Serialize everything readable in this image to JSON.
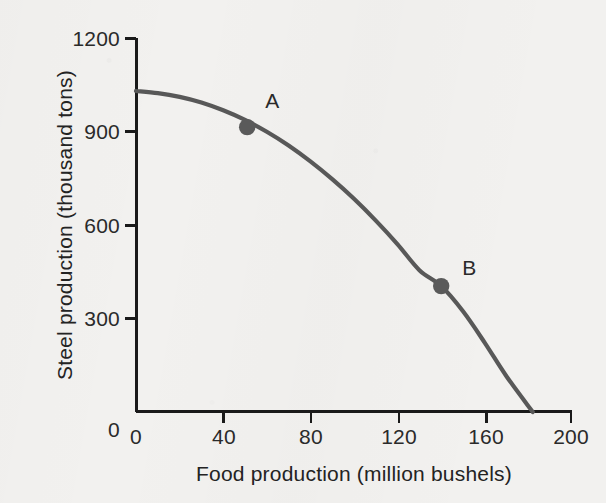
{
  "figure": {
    "width": 606,
    "height": 503,
    "background_color": "#f2f1ef",
    "curve_color": "#585858",
    "axis_color": "#1a1a1a",
    "text_color": "#2a2a2a"
  },
  "chart_data": {
    "type": "line",
    "title": "",
    "subtitle": "",
    "xlabel": "Food production (million bushels)",
    "ylabel": "Steel production (thousand tons)",
    "xlim": [
      0,
      200
    ],
    "ylim": [
      0,
      1200
    ],
    "xticks": [
      0,
      40,
      80,
      120,
      160,
      200
    ],
    "xtick_labels": [
      "0",
      "40",
      "80",
      "120",
      "160",
      "200"
    ],
    "yticks": [
      0,
      300,
      600,
      900,
      1200
    ],
    "ytick_labels": [
      "0",
      "300",
      "600",
      "900",
      "1200"
    ],
    "grid": false,
    "legend": "none",
    "series": [
      {
        "name": "production possibilities frontier",
        "x": [
          0,
          10,
          20,
          30,
          40,
          50,
          60,
          70,
          80,
          90,
          100,
          110,
          120,
          130,
          140,
          150,
          160,
          170,
          182
        ],
        "y": [
          1030,
          1023,
          1011,
          993,
          968,
          937,
          899,
          855,
          804,
          747,
          684,
          614,
          538,
          455,
          404,
          323,
          222,
          114,
          0
        ]
      }
    ],
    "annotations": [
      {
        "label": "A",
        "x": 51,
        "y": 914,
        "label_dx": 18,
        "label_dy": -24
      },
      {
        "label": "B",
        "x": 140,
        "y": 404,
        "label_dx": 21,
        "label_dy": -16
      }
    ]
  },
  "axes": {
    "x_title": "Food production (million bushels)",
    "y_title": "Steel production (thousand tons)",
    "x_tick_labels": [
      "0",
      "40",
      "80",
      "120",
      "160",
      "200"
    ],
    "y_tick_labels": [
      "1200",
      "900",
      "600",
      "300",
      "0"
    ]
  },
  "points": {
    "a_label": "A",
    "b_label": "B"
  }
}
